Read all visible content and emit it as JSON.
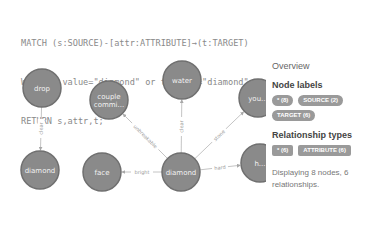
{
  "query": {
    "line1": "MATCH (s:SOURCE)-[attr:ATTRIBUTE]→(t:TARGET)",
    "line2": "WHERE s.value=\"diamond\" or t.value=\"diamond\"",
    "line3": "RETURN s,attr,t;"
  },
  "graph": {
    "nodes": [
      {
        "id": "drop",
        "label": "drop",
        "x": 42,
        "y": 38
      },
      {
        "id": "diamond_left",
        "label": "diamond",
        "x": 40,
        "y": 120
      },
      {
        "id": "couple",
        "label": "couple\ncommi...",
        "x": 109,
        "y": 50
      },
      {
        "id": "face",
        "label": "face",
        "x": 102,
        "y": 122
      },
      {
        "id": "water",
        "label": "water",
        "x": 182,
        "y": 30
      },
      {
        "id": "diamond_center",
        "label": "diamond",
        "x": 181,
        "y": 122
      },
      {
        "id": "you",
        "label": "you...",
        "x": 258,
        "y": 48
      },
      {
        "id": "h",
        "label": "h...",
        "x": 260,
        "y": 113
      }
    ],
    "edges": [
      {
        "from": "drop",
        "to": "diamond_left",
        "label": "clear"
      },
      {
        "from": "diamond_center",
        "to": "couple",
        "label": "unbreakable"
      },
      {
        "from": "diamond_center",
        "to": "water",
        "label": "clear"
      },
      {
        "from": "diamond_center",
        "to": "face",
        "label": "bright"
      },
      {
        "from": "diamond_center",
        "to": "you",
        "label": "stone"
      },
      {
        "from": "diamond_center",
        "to": "h",
        "label": "hard"
      }
    ]
  },
  "overview": {
    "title": "Overview",
    "node_labels_heading": "Node labels",
    "node_labels": [
      "* (8)",
      "SOURCE (2)",
      "TARGET (6)"
    ],
    "relationship_types_heading": "Relationship types",
    "relationship_types": [
      "* (6)",
      "ATTRIBUTE (6)"
    ],
    "description": "Displaying 8 nodes, 6 relationships."
  },
  "colors": {
    "node_fill": "#8a8a8a",
    "badge": "#9a9a9a",
    "edge": "#b5b5b5"
  }
}
